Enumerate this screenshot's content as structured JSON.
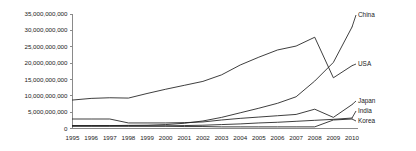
{
  "chart_data": {
    "type": "line",
    "title": "",
    "subtitle": "",
    "xlabel": "",
    "ylabel": "",
    "grid": false,
    "legend_position": "right-inline-labels",
    "x": [
      1995,
      1996,
      1997,
      1998,
      1999,
      2000,
      2001,
      2002,
      2003,
      2004,
      2005,
      2006,
      2007,
      2008,
      2009,
      2010
    ],
    "categories": [
      "1995",
      "1996",
      "1997",
      "1998",
      "1999",
      "2000",
      "2001",
      "2002",
      "2003",
      "2004",
      "2005",
      "2006",
      "2007",
      "2008",
      "2009",
      "2010"
    ],
    "ylim": [
      0,
      35000000000
    ],
    "ytick_values": [
      0,
      5000000000,
      10000000000,
      15000000000,
      20000000000,
      25000000000,
      30000000000,
      35000000000
    ],
    "ytick_labels": [
      "0",
      "5,000,000,000",
      "10,000,000,000",
      "15,000,000,000",
      "20,000,000,000",
      "25,000,000,000",
      "30,000,000,000",
      "35,000,000,000"
    ],
    "series": [
      {
        "name": "USA",
        "label": "USA",
        "values": [
          8700000000,
          9200000000,
          9400000000,
          9300000000,
          10700000000,
          12000000000,
          13200000000,
          14400000000,
          16400000000,
          19400000000,
          21800000000,
          24000000000,
          25200000000,
          27900000000,
          15500000000,
          19200000000
        ]
      },
      {
        "name": "China",
        "label": "China",
        "values": [
          900000000,
          900000000,
          900000000,
          950000000,
          1000000000,
          1200000000,
          1600000000,
          2300000000,
          3400000000,
          4800000000,
          6200000000,
          7700000000,
          9700000000,
          14500000000,
          20200000000,
          31000000000
        ]
      },
      {
        "name": "Japan",
        "label": "Japan",
        "values": [
          2900000000,
          2900000000,
          2900000000,
          1700000000,
          1700000000,
          1700000000,
          1800000000,
          2000000000,
          2600000000,
          3100000000,
          3500000000,
          3900000000,
          4300000000,
          5900000000,
          3400000000,
          7300000000
        ]
      },
      {
        "name": "India",
        "label": "India",
        "values": [
          800000000,
          800000000,
          800000000,
          800000000,
          800000000,
          800000000,
          900000000,
          1000000000,
          1200000000,
          1400000000,
          1700000000,
          1900000000,
          2200000000,
          2500000000,
          2800000000,
          3200000000
        ]
      },
      {
        "name": "Korea",
        "label": "Korea",
        "values": [
          700000000,
          700000000,
          700000000,
          700000000,
          700000000,
          700000000,
          600000000,
          600000000,
          500000000,
          500000000,
          500000000,
          500000000,
          500000000,
          500000000,
          2600000000,
          2900000000
        ]
      }
    ]
  },
  "colors": {
    "line": "#1c1c1c",
    "axis": "#8a8a8a",
    "text": "#1a1a1a",
    "background": "#ffffff"
  }
}
